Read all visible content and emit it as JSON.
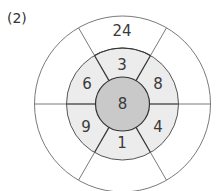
{
  "problem_label": "(2)",
  "colors": {
    "inner_fill": "#c9c9c9",
    "middle_fill": "#ececec",
    "outer_fill": "#ffffff",
    "dark_line": "#333333",
    "light_line": "#7a7a7a"
  },
  "center": {
    "value": "8"
  },
  "middle_ring": {
    "top": "3",
    "upper_right": "8",
    "lower_right": "4",
    "bottom": "1",
    "lower_left": "9",
    "upper_left": "6"
  },
  "outer_ring": {
    "top": "24",
    "upper_right": "",
    "lower_right": "",
    "bottom": "",
    "lower_left": "",
    "upper_left": ""
  }
}
